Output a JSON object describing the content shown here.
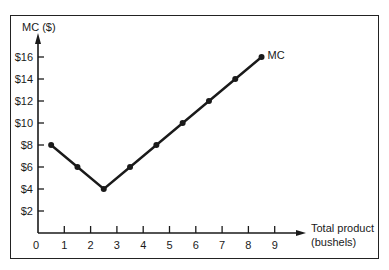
{
  "chart_data": {
    "type": "line",
    "title": "",
    "xlabel": "Total product (bushels)",
    "xlabel_lines": [
      "Total product",
      "(bushels)"
    ],
    "ylabel": "MC ($)",
    "x_ticks": [
      "0",
      "1",
      "2",
      "3",
      "4",
      "5",
      "6",
      "7",
      "8",
      "9"
    ],
    "y_ticks": [
      "$2",
      "$4",
      "$6",
      "$8",
      "$10",
      "$12",
      "$14",
      "$16"
    ],
    "xlim": [
      0,
      9
    ],
    "ylim": [
      0,
      16
    ],
    "grid": false,
    "legend": "none",
    "series": [
      {
        "name": "MC",
        "x": [
          0.5,
          1.5,
          2.5,
          3.5,
          4.5,
          5.5,
          6.5,
          7.5,
          8.5
        ],
        "values": [
          8,
          6,
          4,
          6,
          8,
          10,
          12,
          14,
          16
        ]
      }
    ],
    "annotations": [
      {
        "text": "MC",
        "x": 8.5,
        "y": 16
      }
    ]
  },
  "colors": {
    "line": "#1a1a1a",
    "axis": "#1a1a1a",
    "frame": "#222222",
    "background": "#ffffff"
  }
}
